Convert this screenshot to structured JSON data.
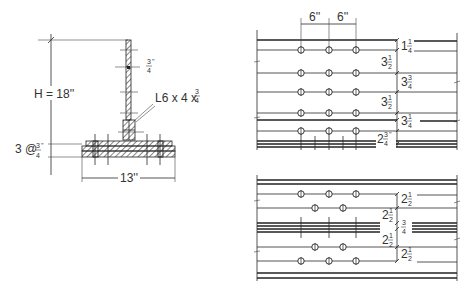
{
  "section_view": {
    "height_label": "H = 18''",
    "web_thickness_label": {
      "num": "3",
      "den": "4",
      "unit": "''"
    },
    "angle_label": {
      "text": "L6 x 4 x",
      "num": "3",
      "den": "4"
    },
    "flange_label": {
      "prefix": "3 @",
      "num": "3",
      "den": "4",
      "unit": "''"
    },
    "width_label": "13''"
  },
  "top_plan": {
    "spacing_labels": [
      "6''",
      "6''"
    ],
    "bolt_columns_x": [
      301,
      329,
      356
    ],
    "bolt_rows_y": [
      50,
      73,
      92,
      113,
      131
    ],
    "vertical_dims": [
      {
        "whole": "1",
        "num": "1",
        "den": "4"
      },
      {
        "whole": "3",
        "num": "1",
        "den": "2"
      },
      {
        "whole": "3",
        "num": "3",
        "den": "4"
      },
      {
        "whole": "3",
        "num": "1",
        "den": "2"
      },
      {
        "whole": "3",
        "num": "1",
        "den": "4"
      },
      {
        "whole": "2",
        "num": "3",
        "den": "4",
        "unit": "''"
      }
    ]
  },
  "bottom_plan": {
    "bolt_rows": [
      {
        "y": 194,
        "x": [
          301,
          329,
          356
        ]
      },
      {
        "y": 208,
        "x": [
          315,
          343
        ]
      },
      {
        "y": 247,
        "x": [
          315,
          343
        ]
      },
      {
        "y": 261,
        "x": [
          301,
          329,
          356
        ]
      }
    ],
    "vertical_dims": [
      {
        "whole": "2",
        "num": "1",
        "den": "2"
      },
      {
        "whole": "2",
        "num": "1",
        "den": "2"
      },
      {
        "whole": "",
        "num": "3",
        "den": "4"
      },
      {
        "whole": "2",
        "num": "1",
        "den": "2"
      },
      {
        "whole": "2",
        "num": "1",
        "den": "2"
      }
    ]
  }
}
